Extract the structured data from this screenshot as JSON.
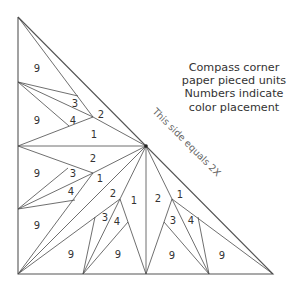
{
  "caption": {
    "lines": [
      "Compass corner",
      "paper pieced units",
      "Numbers indicate",
      "color placement"
    ]
  },
  "hypotenuse_label": "This side equals 2X",
  "units": [
    {
      "name": "upper-left-unit",
      "labels": [
        {
          "text": "9",
          "x": 37,
          "y": 69
        },
        {
          "text": "9",
          "x": 37,
          "y": 121
        },
        {
          "text": "3",
          "x": 75,
          "y": 104
        },
        {
          "text": "4",
          "x": 73,
          "y": 121
        },
        {
          "text": "2",
          "x": 101,
          "y": 115
        },
        {
          "text": "1",
          "x": 94,
          "y": 135
        }
      ]
    },
    {
      "name": "lower-left-unit",
      "labels": [
        {
          "text": "2",
          "x": 93,
          "y": 159
        },
        {
          "text": "9",
          "x": 37,
          "y": 174
        },
        {
          "text": "3",
          "x": 73,
          "y": 174
        },
        {
          "text": "1",
          "x": 100,
          "y": 179
        },
        {
          "text": "4",
          "x": 71,
          "y": 192
        },
        {
          "text": "9",
          "x": 37,
          "y": 226
        }
      ]
    },
    {
      "name": "lower-center-unit",
      "labels": [
        {
          "text": "2",
          "x": 113,
          "y": 194
        },
        {
          "text": "1",
          "x": 134,
          "y": 201
        },
        {
          "text": "3",
          "x": 105,
          "y": 218
        },
        {
          "text": "4",
          "x": 117,
          "y": 222
        },
        {
          "text": "9",
          "x": 71,
          "y": 255
        },
        {
          "text": "9",
          "x": 118,
          "y": 255
        }
      ]
    },
    {
      "name": "lower-right-unit",
      "labels": [
        {
          "text": "2",
          "x": 158,
          "y": 199
        },
        {
          "text": "1",
          "x": 180,
          "y": 195
        },
        {
          "text": "3",
          "x": 173,
          "y": 221
        },
        {
          "text": "4",
          "x": 191,
          "y": 221
        },
        {
          "text": "9",
          "x": 172,
          "y": 256
        },
        {
          "text": "9",
          "x": 222,
          "y": 256
        }
      ]
    }
  ]
}
